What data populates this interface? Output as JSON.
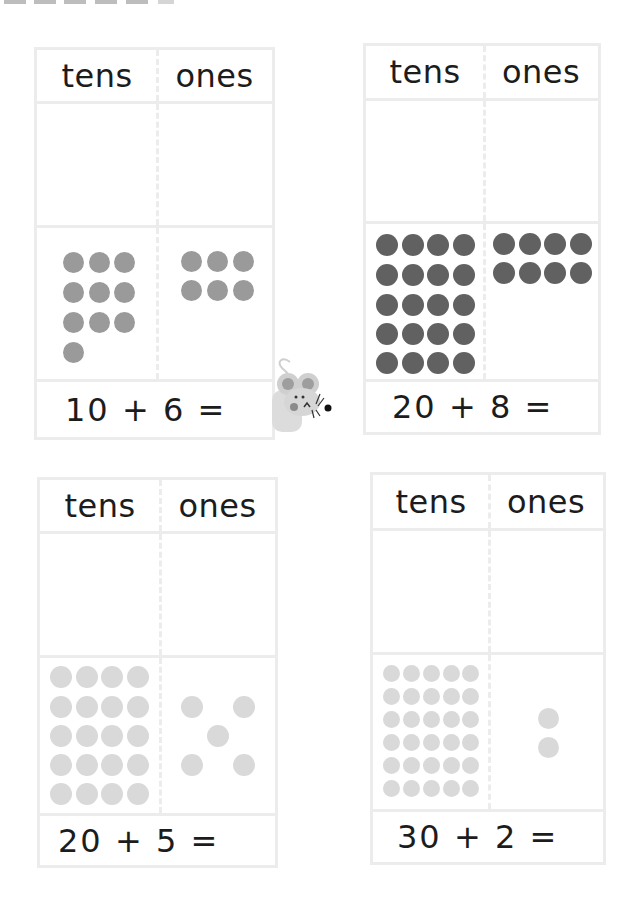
{
  "worksheet": {
    "column_headers": [
      "tens",
      "ones"
    ],
    "colors": {
      "dark_counter": "#616161",
      "medium_counter": "#9a9a9a",
      "light_counter": "#d9d9d9",
      "border": "#ececec"
    },
    "problems": [
      {
        "id": 1,
        "tens_header": "tens",
        "ones_header": "ones",
        "equation": "10 + 6 =",
        "tens_counters": 10,
        "ones_counters": 6,
        "counter_shade": "medium"
      },
      {
        "id": 2,
        "tens_header": "tens",
        "ones_header": "ones",
        "equation": "20 + 8 =",
        "tens_counters": 20,
        "ones_counters": 8,
        "counter_shade": "dark"
      },
      {
        "id": 3,
        "tens_header": "tens",
        "ones_header": "ones",
        "equation": "20 + 5 =",
        "tens_counters": 20,
        "ones_counters": 5,
        "counter_shade": "light"
      },
      {
        "id": 4,
        "tens_header": "tens",
        "ones_header": "ones",
        "equation": "30 + 2 =",
        "tens_counters": 30,
        "ones_counters": 2,
        "counter_shade": "light"
      }
    ]
  },
  "decoration": {
    "mascot": "mouse-icon"
  }
}
